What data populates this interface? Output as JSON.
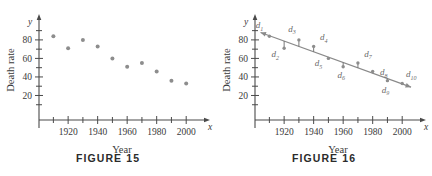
{
  "figures": [
    {
      "caption": "FIGURE 15",
      "axes": {
        "x_var": "x",
        "y_var": "y",
        "xlabel": "Year",
        "ylabel": "Death rate",
        "x_ticklabels": [
          "1920",
          "1940",
          "1960",
          "1980",
          "2000"
        ],
        "y_ticklabels": [
          "20",
          "40",
          "60",
          "80"
        ]
      },
      "show_trendline": false,
      "show_deviation_labels": false
    },
    {
      "caption": "FIGURE 16",
      "axes": {
        "x_var": "x",
        "y_var": "y",
        "xlabel": "Year",
        "ylabel": "Death rate",
        "x_ticklabels": [
          "1920",
          "1940",
          "1960",
          "1980",
          "2000"
        ],
        "y_ticklabels": [
          "20",
          "40",
          "60",
          "80"
        ]
      },
      "show_trendline": true,
      "show_deviation_labels": true,
      "deviation_labels": [
        {
          "base": "d",
          "sub": "1"
        },
        {
          "base": "d",
          "sub": "2"
        },
        {
          "base": "d",
          "sub": "3"
        },
        {
          "base": "d",
          "sub": "4"
        },
        {
          "base": "d",
          "sub": "5"
        },
        {
          "base": "d",
          "sub": "6"
        },
        {
          "base": "d",
          "sub": "7"
        },
        {
          "base": "d",
          "sub": "8"
        },
        {
          "base": "d",
          "sub": "9"
        },
        {
          "base": "d",
          "sub": "10"
        }
      ]
    }
  ],
  "colors": {
    "point": "#8d8d8d",
    "axis": "#4a4a4a",
    "trendline": "#8a8a8a",
    "text": "#3a3a3a",
    "label": "#6a6a6a"
  },
  "chart_data": {
    "type": "scatter",
    "title": "",
    "xlabel": "Year",
    "ylabel": "Death rate",
    "xlim": [
      1905,
      2008
    ],
    "ylim": [
      0,
      95
    ],
    "grid": false,
    "legend": "none",
    "x": [
      1910,
      1920,
      1930,
      1940,
      1950,
      1960,
      1970,
      1980,
      1990,
      2000
    ],
    "y": [
      84,
      71,
      80,
      73,
      60,
      51,
      55,
      46,
      36,
      33
    ],
    "xticks": [
      1910,
      1920,
      1930,
      1940,
      1950,
      1960,
      1970,
      1980,
      1990,
      2000
    ],
    "xtick_labels": [
      "",
      "1920",
      "",
      "1940",
      "",
      "1960",
      "",
      "1980",
      "",
      "2000"
    ],
    "yticks": [
      10,
      20,
      30,
      40,
      50,
      60,
      70,
      80,
      90
    ],
    "ytick_labels": [
      "",
      "20",
      "",
      "40",
      "",
      "60",
      "",
      "80",
      ""
    ],
    "trendline": {
      "x": [
        1904,
        2006
      ],
      "y": [
        88,
        29
      ],
      "label_points": [
        "d1",
        "d2",
        "d3",
        "d4",
        "d5",
        "d6",
        "d7",
        "d8",
        "d9",
        "d10"
      ],
      "description": "Least-squares line with vertical deviation segments d1 through d10 from each data point."
    }
  }
}
